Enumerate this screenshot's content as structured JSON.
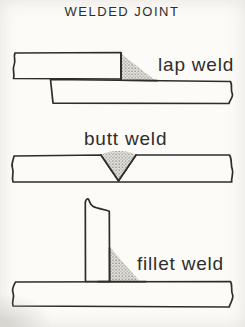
{
  "page": {
    "title": "WELDED JOINT",
    "colors": {
      "paper": "#fcfbf8",
      "ink": "#2e2d2b",
      "stipple-base": "#e3e2dd",
      "stipple-dot": "#8f8d86"
    }
  },
  "diagrams": [
    {
      "id": "lap-weld",
      "label": "lap weld"
    },
    {
      "id": "butt-weld",
      "label": "butt weld"
    },
    {
      "id": "fillet-weld",
      "label": "fillet weld"
    }
  ]
}
